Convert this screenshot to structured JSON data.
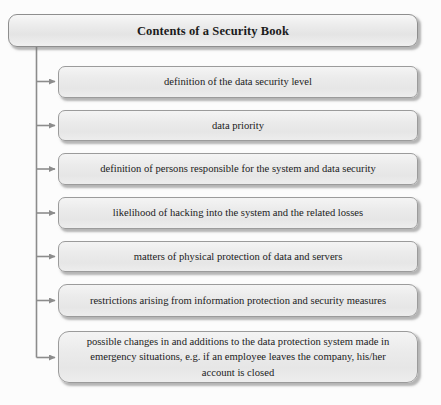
{
  "diagram": {
    "type": "hierarchy-tree",
    "orientation": "vertical-trunk-left",
    "title": {
      "label": "Contents of a Security Book"
    },
    "items": [
      {
        "label": "definition of the data security level"
      },
      {
        "label": "data priority"
      },
      {
        "label": "definition of persons responsible for the system and data security"
      },
      {
        "label": "likelihood of hacking into the system and the related losses"
      },
      {
        "label": "matters of physical protection of data and servers"
      },
      {
        "label": "restrictions arising from information protection and security measures"
      },
      {
        "label": "possible changes in and additions to the data protection system made in emergency situations, e.g. if an employee leaves the company, his/her account is closed"
      }
    ],
    "colors": {
      "background": "#fcfcfc",
      "box_fill_top": "#f4f4f4",
      "box_fill_bottom": "#e6e6e6",
      "box_border": "#9b9b9b",
      "connector": "#8c8c8c",
      "text": "#1b1b1b",
      "shadow": "rgba(120,120,120,0.55)"
    },
    "connector_count": 7
  }
}
